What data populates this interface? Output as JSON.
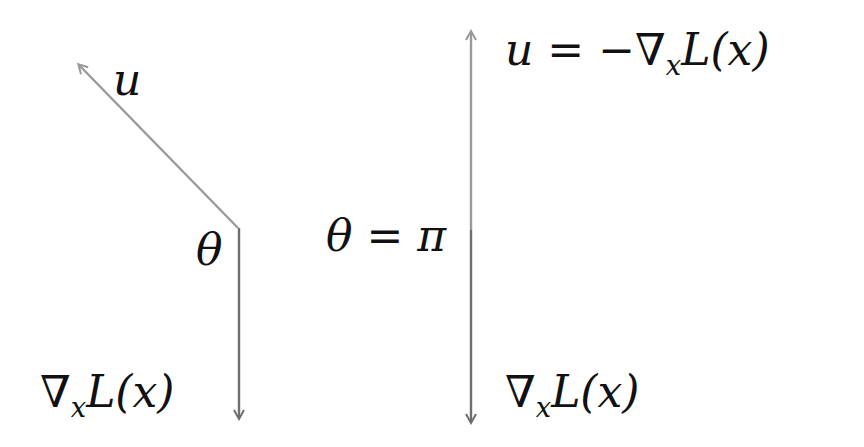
{
  "diagram": {
    "colors": {
      "arrow_light": "#9a9a9a",
      "arrow_dark": "#6e6e6e",
      "text": "#111111",
      "background": "#ffffff"
    },
    "left_panel": {
      "vector_u_label": "u",
      "angle_label": "θ",
      "gradient_label": {
        "nabla": "∇",
        "subscript": "x",
        "function": "L(x)"
      }
    },
    "right_panel": {
      "u_equation": {
        "lhs": "u",
        "equals": " = −",
        "nabla": "∇",
        "subscript": "x",
        "function": "L(x)"
      },
      "angle_equation": "θ = π",
      "gradient_label": {
        "nabla": "∇",
        "subscript": "x",
        "function": "L(x)"
      }
    }
  }
}
